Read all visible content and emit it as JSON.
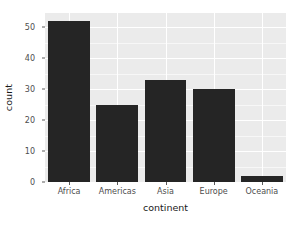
{
  "chart_data": {
    "type": "bar",
    "title": "",
    "subtitle": "",
    "xlabel": "continent",
    "ylabel": "count",
    "categories": [
      "Africa",
      "Americas",
      "Asia",
      "Europe",
      "Oceania"
    ],
    "values": [
      52,
      25,
      33,
      30,
      2
    ],
    "ylim": [
      0,
      54.6
    ],
    "yticks": [
      0,
      10,
      20,
      30,
      40,
      50
    ],
    "ytick_labels": [
      "0",
      "10",
      "20",
      "30",
      "40",
      "50"
    ],
    "xtick_labels": [
      "Africa",
      "Americas",
      "Asia",
      "Europe",
      "Oceania"
    ],
    "grid": true,
    "grid_major_color": "#ffffff",
    "grid_minor_color": "#f7f7f7",
    "legend": null,
    "legend_position": "none",
    "bar_color": "#252525",
    "panel_background": "#ebebeb",
    "plot_background": "#ffffff",
    "axis_text_color": "#4d4d4d",
    "axis_title_color": "#1a1a1a",
    "bar_width_fraction": 0.87,
    "annotations": []
  },
  "axes": {
    "y_title": "count",
    "x_title": "continent"
  }
}
